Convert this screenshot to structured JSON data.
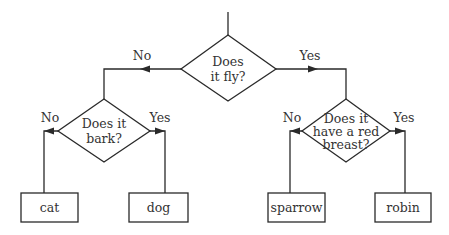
{
  "diagram": {
    "type": "decision-tree",
    "root": {
      "question_lines": [
        "Does",
        "it fly?"
      ],
      "no_label": "No",
      "yes_label": "Yes"
    },
    "bark": {
      "question_lines": [
        "Does it",
        "bark?"
      ],
      "no_label": "No",
      "yes_label": "Yes"
    },
    "breast": {
      "question_lines": [
        "Does it",
        "have a red",
        "breast?"
      ],
      "no_label": "No",
      "yes_label": "Yes"
    },
    "leaves": {
      "cat": "cat",
      "dog": "dog",
      "sparrow": "sparrow",
      "robin": "robin"
    },
    "colors": {
      "stroke": "#2a2a2a",
      "text": "#333333",
      "background": "#ffffff"
    }
  }
}
